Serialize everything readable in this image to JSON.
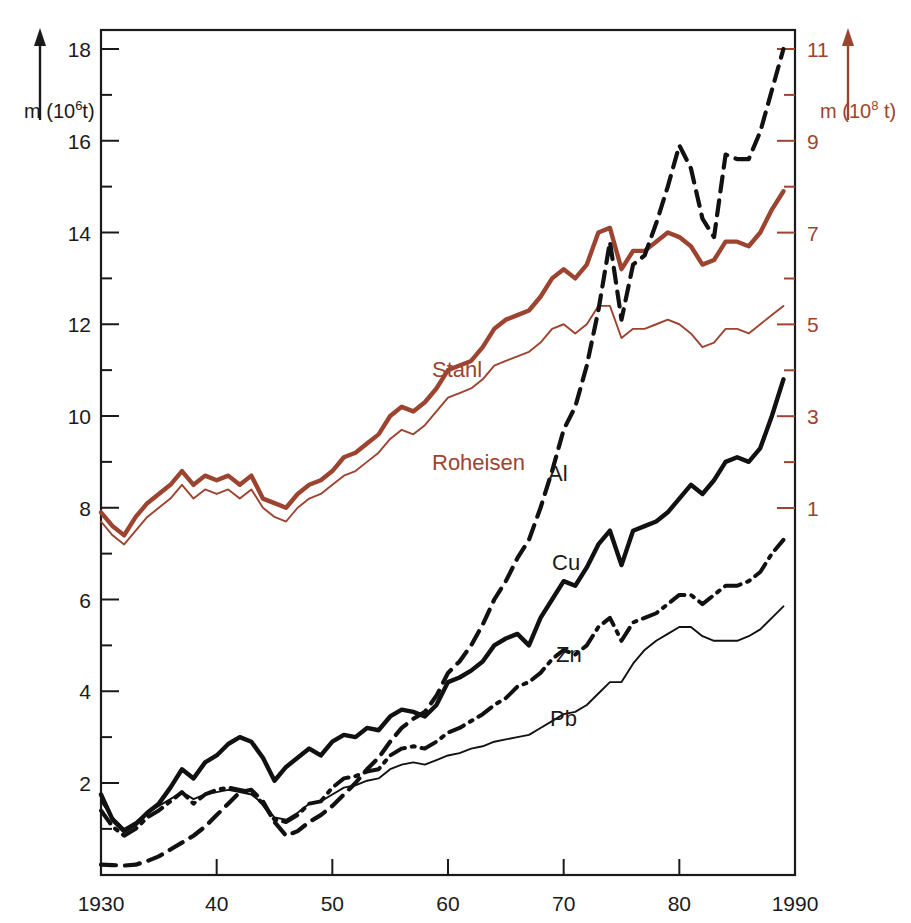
{
  "figure": {
    "background_color": "#ffffff",
    "axis_color": "#1a1a1a",
    "accent_color": "#9c4430"
  },
  "axes": {
    "left_unit_label": "m (10",
    "left_unit_exponent": "6",
    "left_unit_suffix": "t)",
    "right_unit_label": "m (10",
    "right_unit_exponent": "8",
    "right_unit_suffix": " t)",
    "left_ticks": [
      "2",
      "4",
      "6",
      "8",
      "10",
      "12",
      "14",
      "16",
      "18"
    ],
    "right_ticks": [
      "1",
      "3",
      "5",
      "7",
      "9",
      "11"
    ],
    "x_ticks": [
      "1930",
      "40",
      "50",
      "60",
      "70",
      "80",
      "1990"
    ]
  },
  "curve_labels": {
    "stahl": "Stahl",
    "roheisen": "Roheisen",
    "al": "Al",
    "cu": "Cu",
    "zn": "Zn",
    "pb": "Pb"
  },
  "chart_data": {
    "type": "line",
    "title": "",
    "xlabel": "",
    "ylabel": "m (10^6 t)",
    "y2label": "m (10^8 t)",
    "xlim": [
      1930,
      1990
    ],
    "ylim": [
      0,
      18.9
    ],
    "y2lim": [
      0,
      11.9
    ],
    "grid": false,
    "legend": "inline-labels",
    "x_tick_values": [
      1930,
      1940,
      1950,
      1960,
      1970,
      1980,
      1990
    ],
    "x_tick_labels": [
      "1930",
      "40",
      "50",
      "60",
      "70",
      "80",
      "1990"
    ],
    "left_tick_values": [
      2,
      4,
      6,
      8,
      10,
      12,
      14,
      16,
      18
    ],
    "right_tick_values": [
      1,
      3,
      5,
      7,
      9,
      11
    ],
    "left_minor_tick_values": [
      1,
      3,
      5,
      7,
      9,
      11,
      13,
      15,
      17
    ],
    "right_minor_tick_values": [
      2,
      4,
      6,
      8,
      10
    ],
    "x": [
      1930,
      1931,
      1932,
      1933,
      1934,
      1935,
      1936,
      1937,
      1938,
      1939,
      1940,
      1941,
      1942,
      1943,
      1944,
      1945,
      1946,
      1947,
      1948,
      1949,
      1950,
      1951,
      1952,
      1953,
      1954,
      1955,
      1956,
      1957,
      1958,
      1959,
      1960,
      1961,
      1962,
      1963,
      1964,
      1965,
      1966,
      1967,
      1968,
      1969,
      1970,
      1971,
      1972,
      1973,
      1974,
      1975,
      1976,
      1977,
      1978,
      1979,
      1980,
      1981,
      1982,
      1983,
      1984,
      1985,
      1986,
      1987,
      1988,
      1989
    ],
    "series": [
      {
        "name": "Stahl",
        "axis": "right",
        "color": "#9c4430",
        "style": "solid-thick",
        "units": "10^8 t",
        "values_left_scale": [
          7.9,
          7.6,
          7.4,
          7.8,
          8.1,
          8.3,
          8.5,
          8.8,
          8.5,
          8.7,
          8.6,
          8.7,
          8.5,
          8.7,
          8.2,
          8.1,
          8.0,
          8.3,
          8.5,
          8.6,
          8.8,
          9.1,
          9.2,
          9.4,
          9.6,
          10.0,
          10.2,
          10.1,
          10.3,
          10.6,
          11.0,
          11.1,
          11.2,
          11.5,
          11.9,
          12.1,
          12.2,
          12.3,
          12.6,
          13.0,
          13.2,
          13.0,
          13.3,
          14.0,
          14.1,
          13.2,
          13.6,
          13.6,
          13.8,
          14.0,
          13.9,
          13.7,
          13.3,
          13.4,
          13.8,
          13.8,
          13.7,
          14.0,
          14.5,
          14.9
        ]
      },
      {
        "name": "Roheisen",
        "axis": "right",
        "color": "#9c4430",
        "style": "solid-thin",
        "units": "10^8 t",
        "values_left_scale": [
          7.7,
          7.4,
          7.2,
          7.5,
          7.8,
          8.0,
          8.2,
          8.5,
          8.2,
          8.4,
          8.3,
          8.4,
          8.2,
          8.4,
          8.0,
          7.8,
          7.7,
          8.0,
          8.2,
          8.3,
          8.5,
          8.7,
          8.8,
          9.0,
          9.2,
          9.5,
          9.7,
          9.6,
          9.8,
          10.1,
          10.4,
          10.5,
          10.6,
          10.8,
          11.1,
          11.2,
          11.3,
          11.4,
          11.6,
          11.9,
          12.0,
          11.8,
          12.0,
          12.4,
          12.4,
          11.7,
          11.9,
          11.9,
          12.0,
          12.1,
          12.0,
          11.8,
          11.5,
          11.6,
          11.9,
          11.9,
          11.8,
          12.0,
          12.2,
          12.4
        ]
      },
      {
        "name": "Al",
        "axis": "left",
        "color": "#111111",
        "style": "dashed",
        "units": "10^6 t",
        "values_left_scale": [
          0.22,
          0.21,
          0.2,
          0.22,
          0.3,
          0.4,
          0.55,
          0.7,
          0.85,
          1.05,
          1.3,
          1.55,
          1.8,
          1.85,
          1.6,
          1.15,
          0.85,
          0.95,
          1.15,
          1.3,
          1.5,
          1.75,
          2.0,
          2.3,
          2.55,
          2.9,
          3.2,
          3.4,
          3.55,
          3.9,
          4.4,
          4.65,
          5.0,
          5.45,
          6.0,
          6.4,
          6.9,
          7.3,
          8.0,
          8.8,
          9.7,
          10.2,
          11.1,
          12.3,
          13.8,
          12.1,
          13.3,
          13.5,
          14.2,
          15.0,
          15.9,
          15.4,
          14.3,
          13.9,
          15.7,
          15.6,
          15.6,
          16.2,
          17.1,
          18.0
        ]
      },
      {
        "name": "Cu",
        "axis": "left",
        "color": "#111111",
        "style": "solid-thick",
        "units": "10^6 t",
        "values_left_scale": [
          1.75,
          1.2,
          0.95,
          1.1,
          1.35,
          1.55,
          1.9,
          2.3,
          2.1,
          2.45,
          2.6,
          2.85,
          3.0,
          2.9,
          2.55,
          2.05,
          2.35,
          2.55,
          2.75,
          2.6,
          2.9,
          3.05,
          3.0,
          3.2,
          3.15,
          3.45,
          3.6,
          3.55,
          3.45,
          3.7,
          4.2,
          4.3,
          4.45,
          4.65,
          5.0,
          5.15,
          5.25,
          5.0,
          5.6,
          6.0,
          6.4,
          6.3,
          6.7,
          7.2,
          7.5,
          6.75,
          7.5,
          7.6,
          7.7,
          7.9,
          8.2,
          8.5,
          8.3,
          8.6,
          9.0,
          9.1,
          9.0,
          9.3,
          10.0,
          10.8
        ]
      },
      {
        "name": "Zn",
        "axis": "left",
        "color": "#111111",
        "style": "dash-dot",
        "units": "10^6 t",
        "values_left_scale": [
          1.4,
          1.05,
          0.85,
          1.0,
          1.25,
          1.4,
          1.6,
          1.8,
          1.55,
          1.75,
          1.85,
          1.9,
          1.85,
          1.8,
          1.55,
          1.2,
          1.15,
          1.3,
          1.55,
          1.6,
          1.9,
          2.1,
          2.15,
          2.25,
          2.3,
          2.6,
          2.75,
          2.8,
          2.75,
          2.9,
          3.1,
          3.2,
          3.35,
          3.5,
          3.7,
          3.85,
          4.1,
          4.2,
          4.4,
          4.7,
          4.9,
          4.8,
          5.0,
          5.4,
          5.6,
          5.1,
          5.5,
          5.6,
          5.7,
          5.9,
          6.1,
          6.1,
          5.9,
          6.1,
          6.3,
          6.3,
          6.4,
          6.6,
          7.0,
          7.3
        ]
      },
      {
        "name": "Pb",
        "axis": "left",
        "color": "#111111",
        "style": "solid-thin",
        "units": "10^6 t",
        "values_left_scale": [
          1.6,
          1.25,
          1.0,
          1.15,
          1.35,
          1.5,
          1.65,
          1.8,
          1.65,
          1.75,
          1.8,
          1.85,
          1.8,
          1.75,
          1.55,
          1.25,
          1.2,
          1.35,
          1.55,
          1.6,
          1.75,
          1.9,
          1.95,
          2.05,
          2.1,
          2.3,
          2.4,
          2.45,
          2.4,
          2.5,
          2.6,
          2.65,
          2.75,
          2.8,
          2.9,
          2.95,
          3.0,
          3.05,
          3.2,
          3.35,
          3.5,
          3.55,
          3.7,
          3.95,
          4.2,
          4.2,
          4.6,
          4.9,
          5.1,
          5.25,
          5.4,
          5.4,
          5.2,
          5.1,
          5.1,
          5.1,
          5.2,
          5.35,
          5.6,
          5.85
        ]
      }
    ]
  }
}
